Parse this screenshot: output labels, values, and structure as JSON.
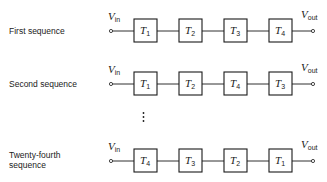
{
  "diagram": {
    "type": "block-diagram",
    "terminals": {
      "input": {
        "symbol": "V",
        "subscript": "in"
      },
      "output": {
        "symbol": "V",
        "subscript": "out"
      }
    },
    "rows": [
      {
        "label": "First sequence",
        "blocks": [
          {
            "symbol": "T",
            "subscript": "1"
          },
          {
            "symbol": "T",
            "subscript": "2"
          },
          {
            "symbol": "T",
            "subscript": "3"
          },
          {
            "symbol": "T",
            "subscript": "4"
          }
        ]
      },
      {
        "label": "Second sequence",
        "blocks": [
          {
            "symbol": "T",
            "subscript": "1"
          },
          {
            "symbol": "T",
            "subscript": "2"
          },
          {
            "symbol": "T",
            "subscript": "4"
          },
          {
            "symbol": "T",
            "subscript": "3"
          }
        ]
      },
      {
        "label_line1": "Twenty-fourth",
        "label_line2": "sequence",
        "blocks": [
          {
            "symbol": "T",
            "subscript": "4"
          },
          {
            "symbol": "T",
            "subscript": "3"
          },
          {
            "symbol": "T",
            "subscript": "2"
          },
          {
            "symbol": "T",
            "subscript": "1"
          }
        ]
      }
    ],
    "ellipsis": "vertical-dots"
  }
}
